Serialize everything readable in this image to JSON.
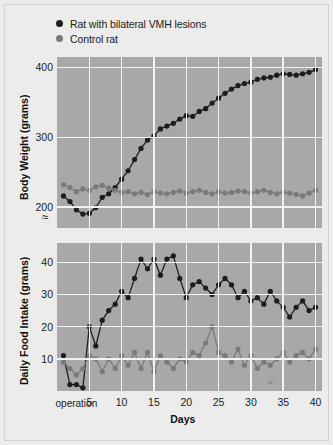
{
  "figure": {
    "background_color": "#ececed",
    "plot_background_color": "#a8a8a8",
    "gridline_color": "#f2f2f2",
    "break_symbol": "≈"
  },
  "legend": {
    "position": "top-left",
    "entries": [
      {
        "label": "Rat with bilateral VMH lesions",
        "color": "#1d1d1d",
        "marker": "circle"
      },
      {
        "label": "Control rat",
        "color": "#7a7a7a",
        "marker": "circle"
      }
    ]
  },
  "annotations": {
    "operation_label": "operation",
    "operation_day": 3,
    "operation_icon": "up-arrow-icon"
  },
  "chart_data": [
    {
      "type": "line",
      "id": "body-weight",
      "title": "",
      "xlabel": "",
      "ylabel": "Body Weight (grams)",
      "xlim": [
        0,
        41
      ],
      "ylim": [
        170,
        415
      ],
      "xticks": [
        5,
        10,
        15,
        20,
        25,
        30,
        35,
        40
      ],
      "yticks": [
        200,
        300,
        400
      ],
      "grid": true,
      "axis_break": true,
      "x": [
        1,
        2,
        3,
        4,
        5,
        6,
        7,
        8,
        9,
        10,
        11,
        12,
        13,
        14,
        15,
        16,
        17,
        18,
        19,
        20,
        21,
        22,
        23,
        24,
        25,
        26,
        27,
        28,
        29,
        30,
        31,
        32,
        33,
        34,
        35,
        36,
        37,
        38,
        39,
        40
      ],
      "series": [
        {
          "name": "Rat with bilateral VMH lesions",
          "color": "#1d1d1d",
          "values": [
            216,
            208,
            196,
            190,
            191,
            199,
            214,
            219,
            228,
            240,
            252,
            268,
            284,
            296,
            302,
            312,
            316,
            320,
            326,
            331,
            330,
            337,
            341,
            349,
            356,
            363,
            369,
            374,
            377,
            379,
            383,
            385,
            386,
            389,
            391,
            390,
            389,
            391,
            393,
            397
          ]
        },
        {
          "name": "Control rat",
          "color": "#7a7a7a",
          "values": [
            232,
            228,
            222,
            226,
            224,
            229,
            231,
            227,
            224,
            221,
            222,
            219,
            221,
            218,
            222,
            220,
            219,
            221,
            223,
            220,
            222,
            224,
            221,
            219,
            222,
            220,
            221,
            223,
            222,
            220,
            222,
            224,
            221,
            219,
            221,
            220,
            218,
            216,
            220,
            224
          ]
        }
      ]
    },
    {
      "type": "line",
      "id": "daily-food-intake",
      "title": "",
      "xlabel": "Days",
      "ylabel": "Daily Food Intake (grams)",
      "xlim": [
        0,
        41
      ],
      "ylim": [
        0,
        46
      ],
      "xticks": [
        5,
        10,
        15,
        20,
        25,
        30,
        35,
        40
      ],
      "yticks": [
        10,
        20,
        30,
        40
      ],
      "grid": true,
      "x": [
        1,
        2,
        3,
        4,
        5,
        6,
        7,
        8,
        9,
        10,
        11,
        12,
        13,
        14,
        15,
        16,
        17,
        18,
        19,
        20,
        21,
        22,
        23,
        24,
        25,
        26,
        27,
        28,
        29,
        30,
        31,
        32,
        33,
        34,
        35,
        36,
        37,
        38,
        39,
        40
      ],
      "series": [
        {
          "name": "Rat with bilateral VMH lesions",
          "color": "#1d1d1d",
          "values": [
            11,
            2,
            2,
            1,
            20,
            14,
            22,
            25,
            27,
            31,
            29,
            35,
            41,
            38,
            41,
            36,
            41,
            42,
            35,
            29,
            33,
            34,
            32,
            30,
            33,
            35,
            33,
            29,
            31,
            28,
            29,
            27,
            31,
            28,
            26,
            23,
            26,
            28,
            25,
            26
          ]
        },
        {
          "name": "Control rat",
          "color": "#7a7a7a",
          "values": [
            9,
            7,
            5,
            7,
            11,
            10,
            6,
            10,
            7,
            11,
            8,
            12,
            7,
            12,
            6,
            11,
            9,
            7,
            10,
            9,
            12,
            11,
            15,
            20,
            12,
            11,
            9,
            13,
            8,
            11,
            7,
            9,
            8,
            10,
            12,
            9,
            11,
            12,
            10,
            13
          ]
        }
      ]
    }
  ]
}
